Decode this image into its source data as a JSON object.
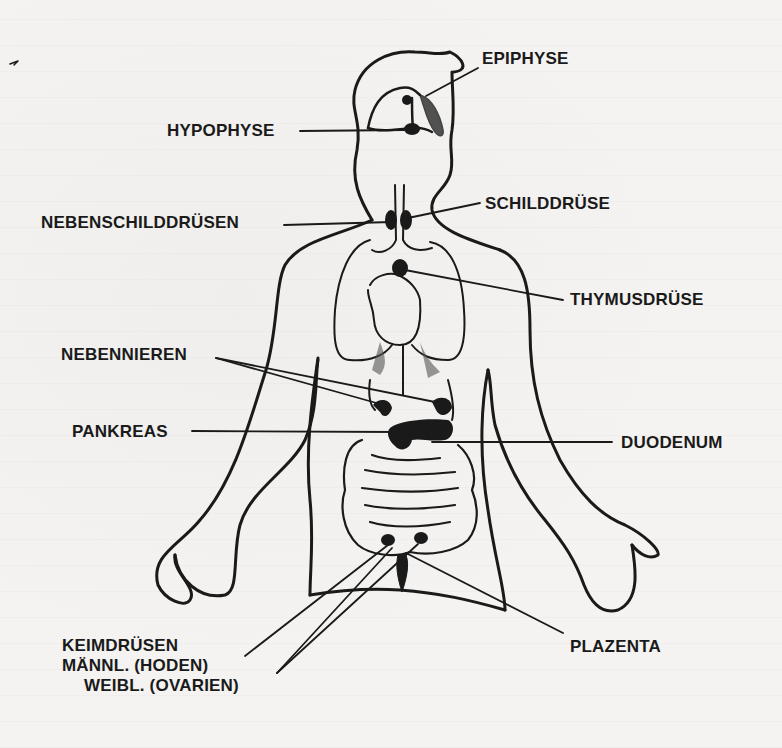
{
  "figure": {
    "language": "de",
    "colors": {
      "ink": "#1a1a1a",
      "paper": "#f4f3f1"
    }
  },
  "labels": {
    "epiphyse": "EPIPHYSE",
    "hypophyse": "HYPOPHYSE",
    "nebenschilddruesen": "NEBENSCHILDDRÜSEN",
    "schilddruese": "SCHILDDRÜSE",
    "thymusdruese": "THYMUSDRÜSE",
    "nebennieren": "NEBENNIEREN",
    "pankreas": "PANKREAS",
    "duodenum": "DUODENUM",
    "plazenta": "PLAZENTA",
    "keimdruesen": {
      "line1": "KEIMDRÜSEN",
      "line2": "MÄNNL. (HODEN)",
      "line3": "WEIBL. (OVARIEN)"
    }
  }
}
